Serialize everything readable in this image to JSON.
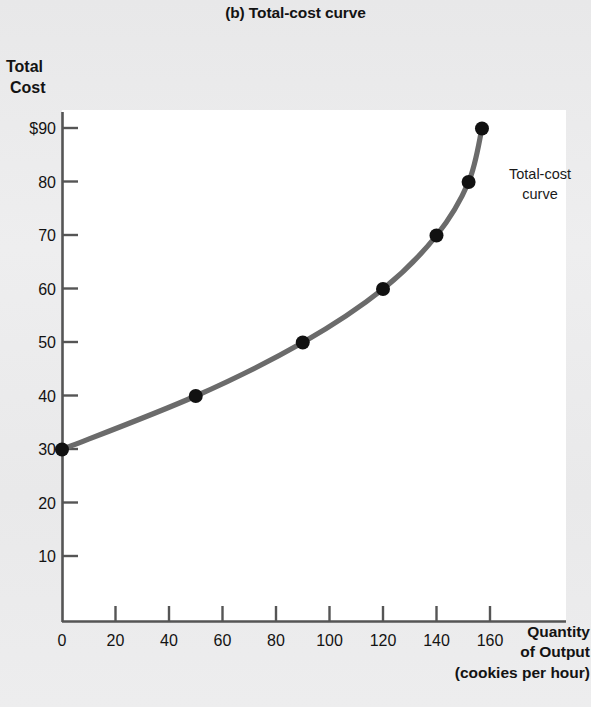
{
  "title": "(b) Total-cost curve",
  "axes": {
    "y_label_line1": "Total",
    "y_label_line2": "Cost",
    "x_label_line1": "Quantity",
    "x_label_line2": "of Output",
    "x_label_line3": "(cookies per hour)",
    "y_ticks": [
      "10",
      "20",
      "30",
      "40",
      "50",
      "60",
      "70",
      "80",
      "$90"
    ],
    "x_ticks": [
      "0",
      "20",
      "40",
      "60",
      "80",
      "100",
      "120",
      "140",
      "160"
    ]
  },
  "annotation": {
    "line1": "Total-cost",
    "line2": "curve"
  },
  "colors": {
    "curve": "#6b6b6b",
    "point": "#111111",
    "axis": "#555555",
    "plot_background": "#ffffff",
    "page_background": "#ececed",
    "text": "#131313"
  },
  "chart_data": {
    "type": "line",
    "title": "(b) Total-cost curve",
    "xlabel": "Quantity of Output (cookies per hour)",
    "ylabel": "Total Cost",
    "xlim": [
      0,
      170
    ],
    "ylim": [
      0,
      95
    ],
    "xticks": [
      0,
      20,
      40,
      60,
      80,
      100,
      120,
      140,
      160
    ],
    "yticks": [
      10,
      20,
      30,
      40,
      50,
      60,
      70,
      80,
      90
    ],
    "grid": false,
    "legend": "none",
    "series": [
      {
        "name": "Total-cost curve",
        "x": [
          0,
          50,
          90,
          120,
          140,
          152,
          157
        ],
        "y": [
          30,
          40,
          50,
          60,
          70,
          80,
          90
        ],
        "markers": true
      }
    ],
    "annotations": [
      {
        "text": "Total-cost curve",
        "x": 165,
        "y": 82
      }
    ]
  }
}
